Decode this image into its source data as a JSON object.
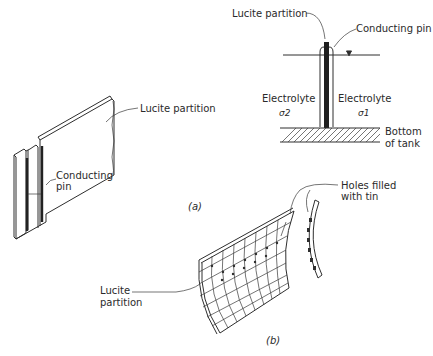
{
  "figure": {
    "panel_a": {
      "caption": "(a)",
      "perspective_view": {
        "label_partition": "Lucite partition",
        "label_pin_line1": "Conducting",
        "label_pin_line2": "pin"
      },
      "section_view": {
        "label_partition": "Lucite partition",
        "label_pin": "Conducting pin",
        "left_medium": "Electrolyte",
        "left_conductivity": "σ2",
        "right_medium": "Electrolyte",
        "right_conductivity": "σ1",
        "bottom_label_line1": "Bottom",
        "bottom_label_line2": "of tank",
        "water_level_symbol": "▽"
      }
    },
    "panel_b": {
      "caption": "(b)",
      "label_holes_line1": "Holes filled",
      "label_holes_line2": "with tin",
      "label_partition_line1": "Lucite",
      "label_partition_line2": "partition"
    },
    "colors": {
      "ink": "#2e2e2e",
      "background": "#ffffff"
    }
  }
}
